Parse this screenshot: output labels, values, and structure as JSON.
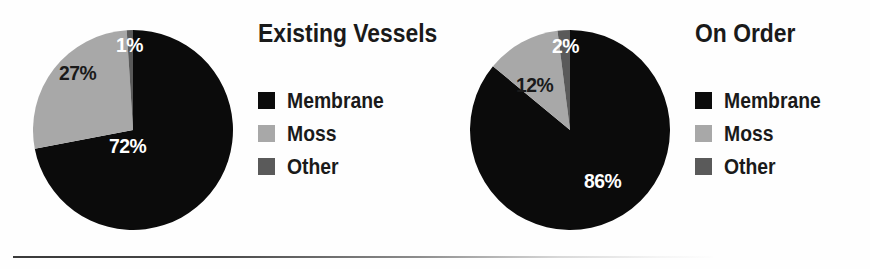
{
  "figure": {
    "background_color": "#fefefe",
    "rule_color": "#3a3a3a"
  },
  "palette": {
    "membrane": "#0b0b0b",
    "moss": "#a8a8a8",
    "other": "#5a5a5a",
    "label_light": "#ffffff",
    "label_dark": "#1a1a1a"
  },
  "charts": [
    {
      "id": "existing-vessels",
      "title": "Existing Vessels",
      "labels": [
        "72%",
        "27%",
        "1%"
      ],
      "legend": [
        {
          "label": "Membrane",
          "swatch": "#0b0b0b"
        },
        {
          "label": "Moss",
          "swatch": "#a8a8a8"
        },
        {
          "label": "Other",
          "swatch": "#5a5a5a"
        }
      ]
    },
    {
      "id": "on-order",
      "title": "On Order",
      "labels": [
        "86%",
        "12%",
        "2%"
      ],
      "legend": [
        {
          "label": "Membrane",
          "swatch": "#0b0b0b"
        },
        {
          "label": "Moss",
          "swatch": "#a8a8a8"
        },
        {
          "label": "Other",
          "swatch": "#5a5a5a"
        }
      ]
    }
  ],
  "chart_data": [
    {
      "type": "pie",
      "title": "Existing Vessels",
      "categories": [
        "Membrane",
        "Moss",
        "Other"
      ],
      "values": [
        72,
        27,
        1
      ],
      "data_labels": [
        "72%",
        "27%",
        "1%"
      ],
      "colors": [
        "#0b0b0b",
        "#a8a8a8",
        "#5a5a5a"
      ],
      "units": "percent",
      "start_angle_deg": 0,
      "direction": "clockwise",
      "legend": "right",
      "grid": false,
      "xlabel": "",
      "ylabel": ""
    },
    {
      "type": "pie",
      "title": "On Order",
      "categories": [
        "Membrane",
        "Moss",
        "Other"
      ],
      "values": [
        86,
        12,
        2
      ],
      "data_labels": [
        "86%",
        "12%",
        "2%"
      ],
      "colors": [
        "#0b0b0b",
        "#a8a8a8",
        "#5a5a5a"
      ],
      "units": "percent",
      "start_angle_deg": 0,
      "direction": "clockwise",
      "legend": "right",
      "grid": false,
      "xlabel": "",
      "ylabel": ""
    }
  ]
}
